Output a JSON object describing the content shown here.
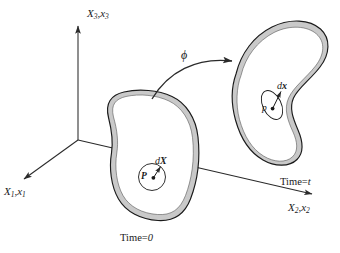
{
  "figure": {
    "type": "continuum-mechanics-deformation-diagram",
    "background_color": "#ffffff",
    "outline_color": "#1a1a1a",
    "shell_fill_color": "#c9c9c9",
    "body_fill_color": "#ffffff"
  },
  "axes": {
    "vertical": {
      "label_X": "X",
      "label_X_sub": "3",
      "label_x": "x",
      "label_x_sub": "3",
      "separator": ",",
      "full_label": "X3,x3",
      "direction": "up"
    },
    "lower_left": {
      "label_X": "X",
      "label_X_sub": "1",
      "label_x": "x",
      "label_x_sub": "1",
      "separator": ",",
      "full_label": "X1,x1",
      "direction": "down-left"
    },
    "lower_right": {
      "label_X": "X",
      "label_X_sub": "2",
      "label_x": "x",
      "label_x_sub": "2",
      "separator": ",",
      "full_label": "X2,x2",
      "direction": "down-right"
    },
    "origin_label": ""
  },
  "reference_body": {
    "time_label_prefix": "Time",
    "time_label_equals": "=",
    "time_label_value": "0",
    "time_label": "Time = 0",
    "point_label": "P",
    "differential_label_d": "d",
    "differential_label_vec": "X",
    "differential_label": "dX",
    "element_shape": "circle"
  },
  "current_body": {
    "time_label_prefix": "Time",
    "time_label_equals": "=",
    "time_label_value": "t",
    "time_label": "Time = t",
    "point_label": "p",
    "differential_label_d": "d",
    "differential_label_vec": "x",
    "differential_label": "dx",
    "element_shape": "ellipse"
  },
  "mapping": {
    "symbol": "ϕ",
    "name": "phi-deformation-map",
    "arrow_direction": "left-to-right-curved"
  }
}
